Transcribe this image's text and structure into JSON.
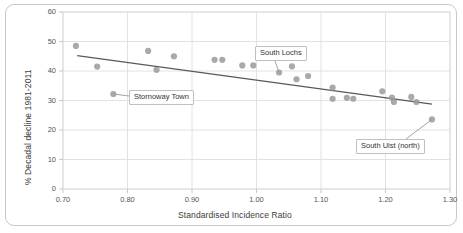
{
  "chart_data": {
    "type": "scatter",
    "title": "",
    "xlabel": "Standardised Incidence Ratio",
    "ylabel": "% Decadal decline 1981-2011",
    "xlim": [
      0.7,
      1.3
    ],
    "ylim": [
      0,
      60
    ],
    "xticks": [
      "0.70",
      "0.80",
      "0.90",
      "1.00",
      "1.10",
      "1.20",
      "1.30"
    ],
    "xtick_values": [
      0.7,
      0.8,
      0.9,
      1.0,
      1.1,
      1.2,
      1.3
    ],
    "yticks": [
      "0",
      "10",
      "20",
      "30",
      "40",
      "50",
      "60"
    ],
    "ytick_values": [
      0,
      10,
      20,
      30,
      40,
      50,
      60
    ],
    "grid": true,
    "legend": "none",
    "point_color": "#9a9a9a",
    "trendline_color": "#595959",
    "gridline_color": "#e2e2e2",
    "axis_text_color": "#555555",
    "points": [
      {
        "x": 0.72,
        "y": 48.5,
        "label": ""
      },
      {
        "x": 0.753,
        "y": 41.5,
        "label": ""
      },
      {
        "x": 0.778,
        "y": 32.2,
        "label": "Stornoway Town"
      },
      {
        "x": 0.832,
        "y": 46.8,
        "label": ""
      },
      {
        "x": 0.845,
        "y": 40.4,
        "label": ""
      },
      {
        "x": 0.872,
        "y": 45.0,
        "label": ""
      },
      {
        "x": 0.935,
        "y": 43.8,
        "label": ""
      },
      {
        "x": 0.947,
        "y": 43.8,
        "label": ""
      },
      {
        "x": 0.978,
        "y": 41.9,
        "label": ""
      },
      {
        "x": 0.995,
        "y": 41.9,
        "label": ""
      },
      {
        "x": 1.035,
        "y": 39.5,
        "label": "South Lochs"
      },
      {
        "x": 1.055,
        "y": 41.6,
        "label": ""
      },
      {
        "x": 1.062,
        "y": 37.2,
        "label": ""
      },
      {
        "x": 1.08,
        "y": 38.3,
        "label": ""
      },
      {
        "x": 1.118,
        "y": 34.4,
        "label": ""
      },
      {
        "x": 1.118,
        "y": 30.6,
        "label": ""
      },
      {
        "x": 1.14,
        "y": 30.9,
        "label": ""
      },
      {
        "x": 1.15,
        "y": 30.6,
        "label": ""
      },
      {
        "x": 1.195,
        "y": 33.1,
        "label": ""
      },
      {
        "x": 1.21,
        "y": 31.0,
        "label": ""
      },
      {
        "x": 1.213,
        "y": 29.5,
        "label": ""
      },
      {
        "x": 1.24,
        "y": 31.2,
        "label": ""
      },
      {
        "x": 1.248,
        "y": 29.5,
        "label": ""
      },
      {
        "x": 1.272,
        "y": 23.6,
        "label": "South Uist (north)"
      }
    ],
    "trendline": {
      "x1": 0.722,
      "y1": 45.2,
      "x2": 1.272,
      "y2": 28.8
    }
  },
  "annotations": [
    {
      "name": "stornoway-town",
      "text": "Stornoway Town"
    },
    {
      "name": "south-lochs",
      "text": "South Lochs"
    },
    {
      "name": "south-uist-north",
      "text": "South Uist (north)"
    }
  ]
}
